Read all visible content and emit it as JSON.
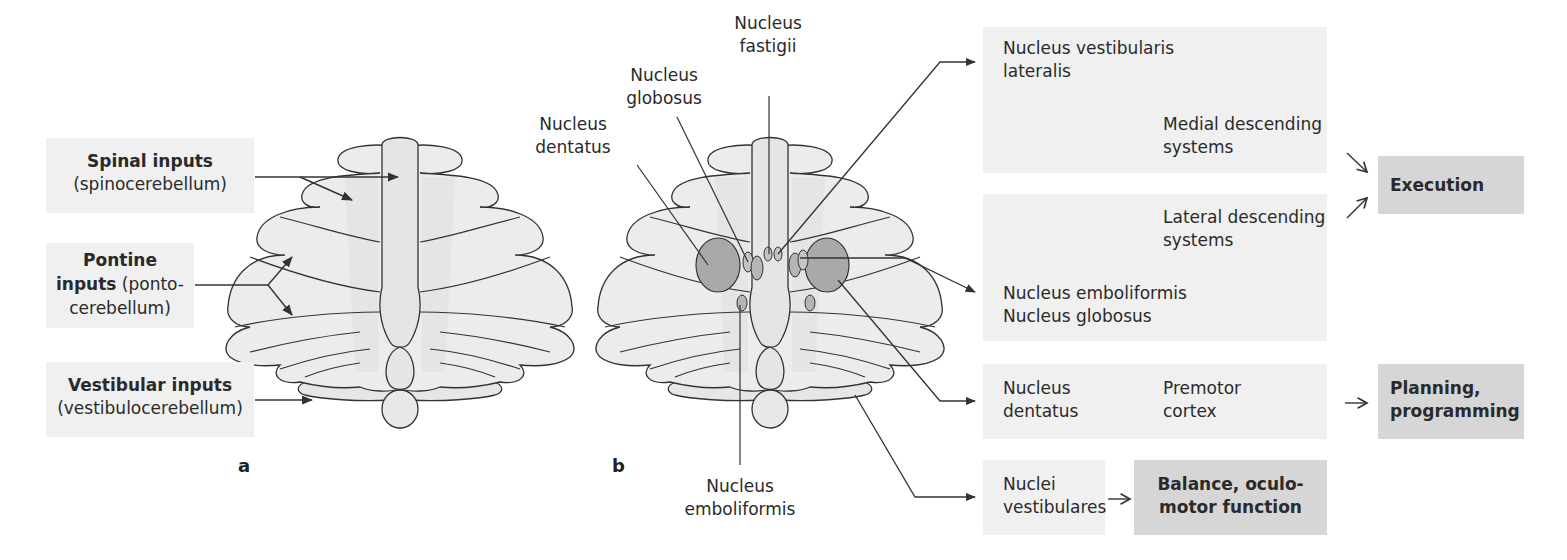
{
  "panel_a": {
    "letter": "a",
    "inputs": [
      {
        "title": "Spinal inputs",
        "subtitle": "(spinocerebellum)"
      },
      {
        "title_line1": "Pontine",
        "title_line2_bold": "inputs",
        "title_line2_rest": " (ponto-",
        "line3": "cerebellum)"
      },
      {
        "title": "Vestibular inputs",
        "subtitle": "(vestibulocerebellum)"
      }
    ]
  },
  "panel_b": {
    "letter": "b",
    "nuclei_labels": {
      "fastigii": [
        "Nucleus",
        "fastigii"
      ],
      "globosus": [
        "Nucleus",
        "globosus"
      ],
      "dentatus": [
        "Nucleus",
        "dentatus"
      ],
      "emboliformis": [
        "Nucleus",
        "emboliformis"
      ]
    }
  },
  "pathways": {
    "vestibular_lateral": {
      "line1": "Nucleus vestibularis",
      "line2": "lateralis",
      "target_line1": "Medial descending",
      "target_line2": "systems"
    },
    "emboliform_globose": {
      "target_line1": "Lateral descending",
      "target_line2": "systems",
      "line1": "Nucleus emboliformis",
      "line2": "Nucleus globosus"
    },
    "dentate": {
      "line1": "Nucleus",
      "line2": "dentatus",
      "target_line1": "Premotor",
      "target_line2": "cortex"
    },
    "vestibular": {
      "line1": "Nuclei",
      "line2": "vestibulares"
    }
  },
  "functions": {
    "execution": "Execution",
    "planning_line1": "Planning,",
    "planning_line2": "programming",
    "balance_line1": "Balance, oculo-",
    "balance_line2": "motor function"
  },
  "colors": {
    "light_box": "#f0f0f0",
    "dark_box": "#d6d6d6",
    "nucleus_fill": "#a9a9a9",
    "lobe_fill": "#ececec",
    "stroke": "#333333"
  }
}
